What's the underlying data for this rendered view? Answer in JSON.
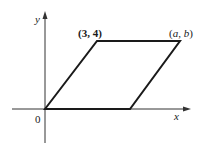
{
  "diagram": {
    "type": "parallelogram-on-axes",
    "axes": {
      "x_label": "x",
      "y_label": "y",
      "origin_label": "0"
    },
    "vertices": [
      {
        "name": "origin",
        "label": "0"
      },
      {
        "name": "top-left",
        "label": "(3, 4)"
      },
      {
        "name": "top-right",
        "label": "(a, b)"
      },
      {
        "name": "bottom-right",
        "label": ""
      }
    ],
    "labels": {
      "point_34": "(3, 4)",
      "point_ab_open": "(",
      "point_ab_a": "a",
      "point_ab_comma": ", ",
      "point_ab_b": "b",
      "point_ab_close": ")"
    },
    "colors": {
      "axis": "#333333",
      "shape": "#1a1a1a",
      "background": "#ffffff"
    }
  }
}
